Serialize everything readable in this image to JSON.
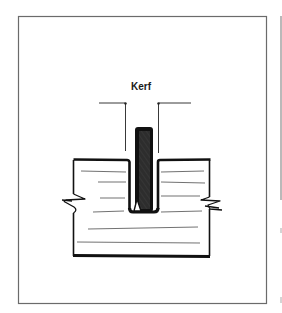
{
  "figure": {
    "label": "Kerf",
    "colors": {
      "ink": "#111111",
      "frame": "#6b6b6b",
      "grain": "#333333",
      "background": "#ffffff"
    },
    "elements": [
      "outer-frame",
      "adjacent-panel-edge",
      "kerf-label",
      "kerf-dimension-lines",
      "saw-blade-hatched",
      "wood-board",
      "wood-grain-lines",
      "break-marks"
    ]
  }
}
